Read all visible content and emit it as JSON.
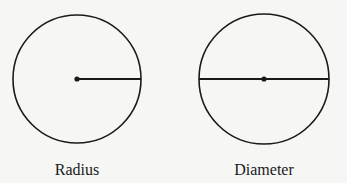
{
  "figure": {
    "left": {
      "label": "Radius",
      "circle": {
        "cx": 77,
        "cy": 79,
        "r": 64
      },
      "segment": {
        "x1": 77,
        "y1": 79,
        "x2": 141,
        "y2": 79
      }
    },
    "right": {
      "label": "Diameter",
      "circle": {
        "cx": 264,
        "cy": 79,
        "r": 65
      },
      "segment": {
        "x1": 199,
        "y1": 79,
        "x2": 329,
        "y2": 79
      }
    },
    "colors": {
      "stroke": "#1a1a1a",
      "background": "#f6f6f5"
    }
  }
}
